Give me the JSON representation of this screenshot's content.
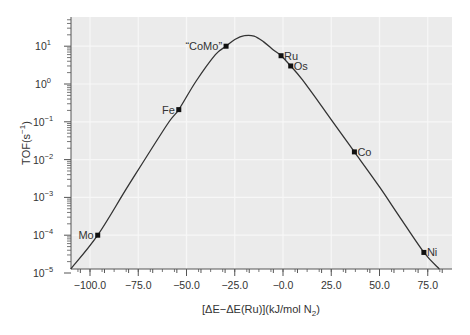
{
  "chart_data": {
    "type": "line",
    "title": "",
    "xlabel": "[ΔE−ΔE(Ru)](kJ/mol N₂)",
    "xlabel_parts": {
      "main": "[ΔE−ΔE(Ru)](kJ/mol N",
      "sub": "2",
      "tail": ")"
    },
    "ylabel": "TOF(s⁻¹)",
    "ylabel_parts": {
      "main": "TOF(s",
      "sup": "−1",
      "tail": ")"
    },
    "xlim": [
      -110,
      87
    ],
    "ylim": [
      1e-05,
      40
    ],
    "yscale": "log",
    "grid": true,
    "legend": null,
    "x_ticks": [
      -100,
      -75,
      -50,
      -25,
      0,
      25,
      50,
      75
    ],
    "x_tick_labels": [
      "−100.0",
      "−75.0",
      "−50.0",
      "−25.0",
      "−0.0",
      "25.0",
      "50.0",
      "75.0"
    ],
    "y_ticks_exponents": [
      1,
      0,
      -1,
      -2,
      -3,
      -4,
      -5
    ],
    "y_tick_base": "10",
    "curve": {
      "name": "volcano",
      "x": [
        -110,
        -96,
        -80,
        -60,
        -54,
        -45,
        -35,
        -29.5,
        -25,
        -20,
        -15,
        -10,
        -5,
        -1,
        4,
        10,
        20,
        30,
        37,
        50,
        60,
        73,
        81
      ],
      "y": [
        5.5e-06,
        0.0001,
        0.0021,
        0.085,
        0.21,
        1.2,
        6.0,
        10,
        15,
        19,
        18.5,
        13,
        8.0,
        5.6,
        3.0,
        1.3,
        0.26,
        0.05,
        0.016,
        0.0019,
        0.00033,
        3.5e-05,
        1e-05
      ]
    },
    "points": [
      {
        "label": "Mo",
        "x": -96,
        "y": 0.0001,
        "label_pos": "left"
      },
      {
        "label": "Fe",
        "x": -54,
        "y": 0.21,
        "label_pos": "left"
      },
      {
        "label": "“CoMo”",
        "x": -29.5,
        "y": 10,
        "label_pos": "left"
      },
      {
        "label": "Ru",
        "x": -1,
        "y": 5.6,
        "label_pos": "right"
      },
      {
        "label": "Os",
        "x": 4,
        "y": 3.0,
        "label_pos": "right"
      },
      {
        "label": "Co",
        "x": 37,
        "y": 0.016,
        "label_pos": "right"
      },
      {
        "label": "Ni",
        "x": 73,
        "y": 3.5e-05,
        "label_pos": "right"
      }
    ],
    "colors": {
      "panel_bg": "#ebebeb",
      "grid": "#f7f7f7",
      "line": "#333333",
      "axis": "#555555",
      "text": "#333333"
    }
  }
}
